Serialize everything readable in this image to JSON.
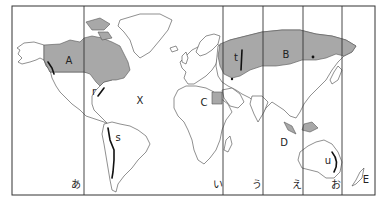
{
  "map": {
    "type": "world map with time-zone style meridian lines",
    "colors": {
      "border": "#333333",
      "meridian": "#333333",
      "land_fill": "#ffffff",
      "land_stroke": "#444444",
      "shaded_fill": "#a8a8a8",
      "mountain_line": "#111111"
    },
    "frame": {
      "x": 12,
      "y": 6,
      "width": 363,
      "height": 189
    },
    "meridian_lines_x": [
      84,
      223,
      263,
      303,
      342
    ],
    "region_labels": [
      {
        "id": "A",
        "text": "A",
        "x": 69,
        "y": 61
      },
      {
        "id": "B",
        "text": "B",
        "x": 286,
        "y": 55
      },
      {
        "id": "C",
        "text": "C",
        "x": 204,
        "y": 103
      },
      {
        "id": "D",
        "text": "D",
        "x": 284,
        "y": 143
      },
      {
        "id": "E",
        "text": "E",
        "x": 366,
        "y": 180
      },
      {
        "id": "X",
        "text": "X",
        "x": 140,
        "y": 101
      }
    ],
    "feature_labels": [
      {
        "id": "r",
        "text": "r",
        "x": 94,
        "y": 92
      },
      {
        "id": "s",
        "text": "s",
        "x": 113,
        "y": 138
      },
      {
        "id": "t",
        "text": "t",
        "x": 236,
        "y": 58
      },
      {
        "id": "u",
        "text": "u",
        "x": 328,
        "y": 161
      }
    ],
    "meridian_labels": [
      {
        "id": "a",
        "text": "あ",
        "x": 76,
        "y": 185
      },
      {
        "id": "i",
        "text": "い",
        "x": 218,
        "y": 185
      },
      {
        "id": "u",
        "text": "う",
        "x": 257,
        "y": 185
      },
      {
        "id": "e",
        "text": "え",
        "x": 297,
        "y": 185
      },
      {
        "id": "o",
        "text": "お",
        "x": 336,
        "y": 185
      }
    ],
    "shaded_regions": [
      "Canada (A)",
      "Russia (B)",
      "Egypt area (C)",
      "Southeast Asia islands"
    ],
    "mountain_lines": [
      "Appalachians (r)",
      "Andes (s)",
      "Urals (t)",
      "Great Dividing Range (u)",
      "Rockies/Alaska coast"
    ]
  }
}
